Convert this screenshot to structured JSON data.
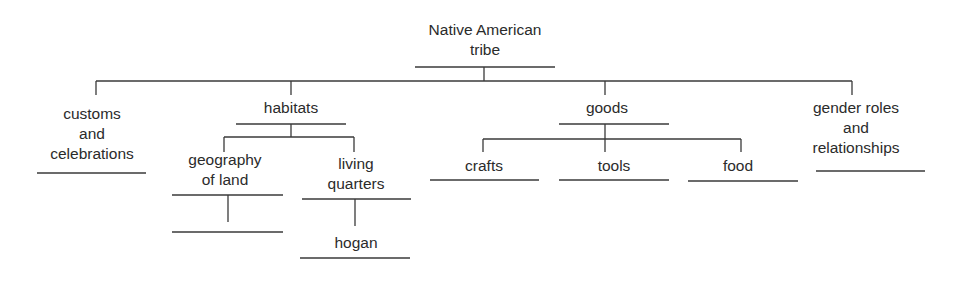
{
  "diagram": {
    "type": "tree-graphic-organizer",
    "root": {
      "label": "Native American\ntribe"
    },
    "level1": [
      {
        "label": "customs\nand\ncelebrations",
        "children": []
      },
      {
        "label": "habitats",
        "children": [
          {
            "label": "geography\nof land",
            "children": [
              {
                "label": ""
              }
            ]
          },
          {
            "label": "living\nquarters",
            "children": [
              {
                "label": "hogan"
              }
            ]
          }
        ]
      },
      {
        "label": "goods",
        "children": [
          {
            "label": "crafts"
          },
          {
            "label": "tools"
          },
          {
            "label": "food"
          }
        ]
      },
      {
        "label": "gender roles\nand\nrelationships",
        "children": []
      }
    ],
    "line_color": "#3a3a3a",
    "text_color": "#2b2b2b"
  }
}
